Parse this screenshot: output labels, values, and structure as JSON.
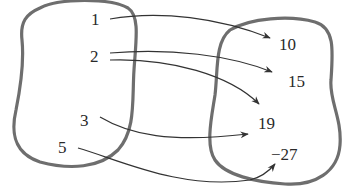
{
  "diagram": {
    "type": "mapping",
    "domain_set": {
      "elements": [
        {
          "label": "1",
          "x": 96,
          "y": 26
        },
        {
          "label": "2",
          "x": 96,
          "y": 62
        },
        {
          "label": "3",
          "x": 86,
          "y": 126
        },
        {
          "label": "5",
          "x": 63,
          "y": 152
        }
      ]
    },
    "range_set": {
      "elements": [
        {
          "label": "10",
          "x": 283,
          "y": 48
        },
        {
          "label": "15",
          "x": 291,
          "y": 86
        },
        {
          "label": "19",
          "x": 270,
          "y": 128
        },
        {
          "label": "−27",
          "x": 282,
          "y": 159
        }
      ]
    },
    "mappings": [
      {
        "from": "1",
        "to": "10"
      },
      {
        "from": "2",
        "to": "15"
      },
      {
        "from": "2",
        "to": "19"
      },
      {
        "from": "3",
        "to": "19"
      },
      {
        "from": "5",
        "to": "−27"
      }
    ],
    "colors": {
      "outline": "#6e6e6e",
      "arrow": "#333333",
      "text": "#2a2a2a"
    }
  }
}
